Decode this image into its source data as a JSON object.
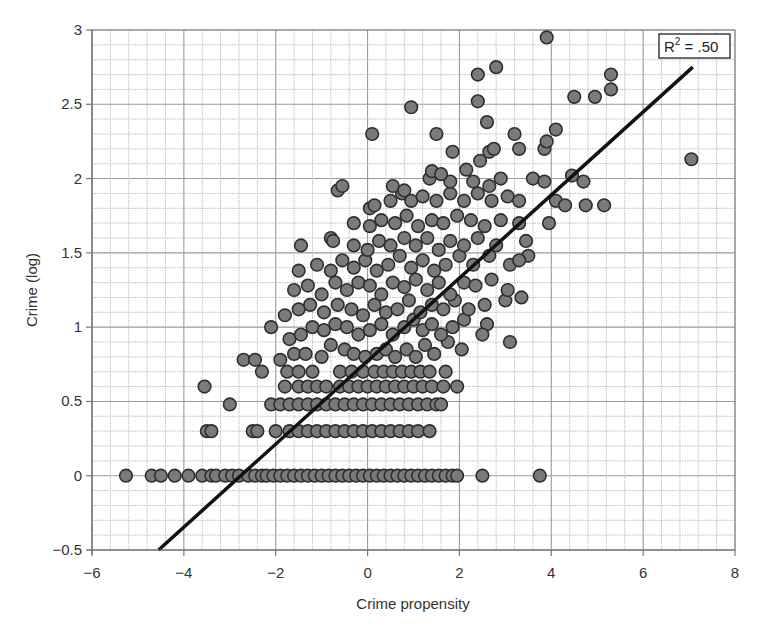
{
  "chart_data": {
    "type": "scatter",
    "title": "",
    "xlabel": "Crime propensity",
    "ylabel": "Crime (log)",
    "xlim": [
      -6,
      8
    ],
    "ylim": [
      -0.5,
      3
    ],
    "x_ticks": [
      -6,
      -4,
      -2,
      0,
      2,
      4,
      6,
      8
    ],
    "x_tick_labels": [
      "−6",
      "−4",
      "−2",
      "0",
      "2",
      "4",
      "6",
      "8"
    ],
    "y_ticks": [
      -0.5,
      0,
      0.5,
      1,
      1.5,
      2,
      2.5,
      3
    ],
    "y_tick_labels": [
      "−0.5",
      "0",
      "0.5",
      "1",
      "1.5",
      "2",
      "2.5",
      "3"
    ],
    "grid": true,
    "legend": null,
    "annotation": {
      "text_base": "R",
      "text_sup": "2",
      "text_rest": " = .50",
      "position": "top-right"
    },
    "regression_line": {
      "x": [
        -4.55,
        7.08
      ],
      "y": [
        -0.5,
        2.75
      ],
      "r_squared": 0.5
    },
    "marker_fill": "#7a7a7a",
    "marker_stroke": "#2e2e2e",
    "line_color": "#111111",
    "series": [
      {
        "name": "observations",
        "points": [
          [
            -5.26,
            0
          ],
          [
            -4.7,
            0
          ],
          [
            -4.5,
            0
          ],
          [
            -4.2,
            0
          ],
          [
            -3.9,
            0
          ],
          [
            -3.6,
            0
          ],
          [
            -3.4,
            0
          ],
          [
            -3.3,
            0
          ],
          [
            -3.1,
            0
          ],
          [
            -2.95,
            0
          ],
          [
            -2.8,
            0
          ],
          [
            -2.6,
            0
          ],
          [
            -2.45,
            0
          ],
          [
            -2.3,
            0
          ],
          [
            -2.2,
            0
          ],
          [
            -2.05,
            0
          ],
          [
            -1.9,
            0
          ],
          [
            -1.75,
            0
          ],
          [
            -1.6,
            0
          ],
          [
            -1.45,
            0
          ],
          [
            -1.3,
            0
          ],
          [
            -1.15,
            0
          ],
          [
            -1.0,
            0
          ],
          [
            -0.85,
            0
          ],
          [
            -0.7,
            0
          ],
          [
            -0.55,
            0
          ],
          [
            -0.4,
            0
          ],
          [
            -0.25,
            0
          ],
          [
            -0.1,
            0
          ],
          [
            0.05,
            0
          ],
          [
            0.2,
            0
          ],
          [
            0.35,
            0
          ],
          [
            0.5,
            0
          ],
          [
            0.65,
            0
          ],
          [
            0.8,
            0
          ],
          [
            0.95,
            0
          ],
          [
            1.1,
            0
          ],
          [
            1.25,
            0
          ],
          [
            1.4,
            0
          ],
          [
            1.55,
            0
          ],
          [
            1.7,
            0
          ],
          [
            1.85,
            0
          ],
          [
            1.95,
            0
          ],
          [
            2.5,
            0
          ],
          [
            3.75,
            0
          ],
          [
            -3.5,
            0.3
          ],
          [
            -3.4,
            0.3
          ],
          [
            -2.5,
            0.3
          ],
          [
            -2.4,
            0.3
          ],
          [
            -2.0,
            0.3
          ],
          [
            -1.7,
            0.3
          ],
          [
            -1.5,
            0.3
          ],
          [
            -1.3,
            0.3
          ],
          [
            -1.1,
            0.3
          ],
          [
            -0.9,
            0.3
          ],
          [
            -0.7,
            0.3
          ],
          [
            -0.5,
            0.3
          ],
          [
            -0.3,
            0.3
          ],
          [
            -0.1,
            0.3
          ],
          [
            0.1,
            0.3
          ],
          [
            0.3,
            0.3
          ],
          [
            0.5,
            0.3
          ],
          [
            0.7,
            0.3
          ],
          [
            0.9,
            0.3
          ],
          [
            1.1,
            0.3
          ],
          [
            1.35,
            0.3
          ],
          [
            -3.0,
            0.48
          ],
          [
            -2.1,
            0.48
          ],
          [
            -1.9,
            0.48
          ],
          [
            -1.7,
            0.48
          ],
          [
            -1.5,
            0.48
          ],
          [
            -1.3,
            0.48
          ],
          [
            -1.1,
            0.48
          ],
          [
            -0.9,
            0.48
          ],
          [
            -0.7,
            0.48
          ],
          [
            -0.5,
            0.48
          ],
          [
            -0.3,
            0.48
          ],
          [
            -0.1,
            0.48
          ],
          [
            0.1,
            0.48
          ],
          [
            0.3,
            0.48
          ],
          [
            0.5,
            0.48
          ],
          [
            0.7,
            0.48
          ],
          [
            0.9,
            0.48
          ],
          [
            1.1,
            0.48
          ],
          [
            1.3,
            0.48
          ],
          [
            1.5,
            0.48
          ],
          [
            1.6,
            0.48
          ],
          [
            -3.55,
            0.6
          ],
          [
            -1.8,
            0.6
          ],
          [
            -1.5,
            0.6
          ],
          [
            -1.3,
            0.6
          ],
          [
            -1.1,
            0.6
          ],
          [
            -0.9,
            0.6
          ],
          [
            -0.6,
            0.6
          ],
          [
            -0.4,
            0.6
          ],
          [
            -0.2,
            0.6
          ],
          [
            0.0,
            0.6
          ],
          [
            0.2,
            0.6
          ],
          [
            0.4,
            0.6
          ],
          [
            0.6,
            0.6
          ],
          [
            0.8,
            0.6
          ],
          [
            1.0,
            0.6
          ],
          [
            1.2,
            0.6
          ],
          [
            1.4,
            0.6
          ],
          [
            1.65,
            0.6
          ],
          [
            1.95,
            0.6
          ],
          [
            -2.7,
            0.78
          ],
          [
            -2.45,
            0.78
          ],
          [
            -2.3,
            0.7
          ],
          [
            -1.75,
            0.7
          ],
          [
            -1.5,
            0.7
          ],
          [
            -1.2,
            0.7
          ],
          [
            -0.6,
            0.7
          ],
          [
            -0.35,
            0.7
          ],
          [
            -0.1,
            0.7
          ],
          [
            0.15,
            0.7
          ],
          [
            0.35,
            0.7
          ],
          [
            0.55,
            0.7
          ],
          [
            0.75,
            0.7
          ],
          [
            0.95,
            0.7
          ],
          [
            1.15,
            0.7
          ],
          [
            1.35,
            0.7
          ],
          [
            1.7,
            0.7
          ],
          [
            -1.9,
            0.78
          ],
          [
            -1.6,
            0.82
          ],
          [
            -1.35,
            0.82
          ],
          [
            -1.0,
            0.8
          ],
          [
            -0.8,
            0.88
          ],
          [
            -0.5,
            0.85
          ],
          [
            -0.3,
            0.82
          ],
          [
            -0.05,
            0.8
          ],
          [
            0.2,
            0.82
          ],
          [
            0.4,
            0.85
          ],
          [
            0.6,
            0.8
          ],
          [
            0.85,
            0.85
          ],
          [
            1.05,
            0.8
          ],
          [
            1.25,
            0.88
          ],
          [
            1.45,
            0.82
          ],
          [
            1.75,
            0.9
          ],
          [
            2.05,
            0.85
          ],
          [
            -2.1,
            1.0
          ],
          [
            -1.7,
            0.92
          ],
          [
            -1.45,
            0.95
          ],
          [
            -1.2,
            1.0
          ],
          [
            -0.95,
            0.98
          ],
          [
            -0.7,
            1.02
          ],
          [
            -0.45,
            1.0
          ],
          [
            -0.2,
            0.95
          ],
          [
            0.05,
            0.98
          ],
          [
            0.3,
            1.02
          ],
          [
            0.55,
            0.95
          ],
          [
            0.8,
            1.0
          ],
          [
            1.0,
            1.05
          ],
          [
            1.2,
            0.98
          ],
          [
            1.4,
            1.02
          ],
          [
            1.6,
            0.95
          ],
          [
            1.85,
            1.0
          ],
          [
            2.1,
            1.05
          ],
          [
            2.6,
            1.02
          ],
          [
            2.5,
            0.95
          ],
          [
            3.1,
            0.9
          ],
          [
            -1.8,
            1.08
          ],
          [
            -1.5,
            1.12
          ],
          [
            -1.25,
            1.15
          ],
          [
            -0.95,
            1.1
          ],
          [
            -0.65,
            1.15
          ],
          [
            -0.35,
            1.12
          ],
          [
            -0.1,
            1.08
          ],
          [
            0.15,
            1.15
          ],
          [
            0.4,
            1.1
          ],
          [
            0.65,
            1.12
          ],
          [
            0.9,
            1.18
          ],
          [
            1.15,
            1.1
          ],
          [
            1.4,
            1.15
          ],
          [
            1.65,
            1.12
          ],
          [
            1.9,
            1.18
          ],
          [
            2.2,
            1.12
          ],
          [
            2.55,
            1.15
          ],
          [
            3.0,
            1.18
          ],
          [
            3.35,
            1.2
          ],
          [
            -1.6,
            1.25
          ],
          [
            -1.3,
            1.28
          ],
          [
            -1.0,
            1.22
          ],
          [
            -0.7,
            1.3
          ],
          [
            -0.45,
            1.25
          ],
          [
            -0.2,
            1.3
          ],
          [
            0.05,
            1.28
          ],
          [
            0.3,
            1.22
          ],
          [
            0.55,
            1.3
          ],
          [
            0.8,
            1.27
          ],
          [
            1.05,
            1.32
          ],
          [
            1.3,
            1.25
          ],
          [
            1.55,
            1.3
          ],
          [
            1.8,
            1.22
          ],
          [
            2.1,
            1.3
          ],
          [
            2.35,
            1.28
          ],
          [
            2.7,
            1.32
          ],
          [
            3.05,
            1.25
          ],
          [
            -1.5,
            1.38
          ],
          [
            -1.1,
            1.42
          ],
          [
            -0.8,
            1.38
          ],
          [
            -0.55,
            1.45
          ],
          [
            -0.3,
            1.4
          ],
          [
            -0.05,
            1.45
          ],
          [
            0.2,
            1.38
          ],
          [
            0.45,
            1.42
          ],
          [
            0.7,
            1.48
          ],
          [
            0.95,
            1.4
          ],
          [
            1.2,
            1.45
          ],
          [
            1.45,
            1.38
          ],
          [
            1.7,
            1.42
          ],
          [
            2.0,
            1.48
          ],
          [
            2.3,
            1.42
          ],
          [
            2.65,
            1.48
          ],
          [
            3.1,
            1.42
          ],
          [
            3.5,
            1.48
          ],
          [
            -1.45,
            1.55
          ],
          [
            -0.8,
            1.6
          ],
          [
            -0.75,
            1.58
          ],
          [
            -0.3,
            1.55
          ],
          [
            0.0,
            1.52
          ],
          [
            0.25,
            1.58
          ],
          [
            0.5,
            1.55
          ],
          [
            0.8,
            1.6
          ],
          [
            1.05,
            1.55
          ],
          [
            1.3,
            1.6
          ],
          [
            1.55,
            1.52
          ],
          [
            1.8,
            1.58
          ],
          [
            2.1,
            1.55
          ],
          [
            2.4,
            1.6
          ],
          [
            2.8,
            1.55
          ],
          [
            3.45,
            1.58
          ],
          [
            3.3,
            1.45
          ],
          [
            -0.3,
            1.7
          ],
          [
            0.05,
            1.68
          ],
          [
            0.3,
            1.72
          ],
          [
            0.6,
            1.7
          ],
          [
            0.85,
            1.75
          ],
          [
            1.1,
            1.68
          ],
          [
            1.4,
            1.72
          ],
          [
            1.65,
            1.7
          ],
          [
            1.95,
            1.75
          ],
          [
            2.25,
            1.72
          ],
          [
            2.55,
            1.68
          ],
          [
            2.9,
            1.72
          ],
          [
            3.3,
            1.7
          ],
          [
            3.95,
            1.7
          ],
          [
            0.05,
            1.8
          ],
          [
            0.15,
            1.82
          ],
          [
            0.5,
            1.85
          ],
          [
            0.75,
            1.9
          ],
          [
            0.95,
            1.85
          ],
          [
            1.2,
            1.88
          ],
          [
            1.5,
            1.85
          ],
          [
            1.8,
            1.9
          ],
          [
            2.1,
            1.85
          ],
          [
            2.4,
            1.9
          ],
          [
            2.7,
            1.85
          ],
          [
            3.05,
            1.88
          ],
          [
            3.3,
            1.85
          ],
          [
            4.1,
            1.85
          ],
          [
            4.3,
            1.82
          ],
          [
            4.75,
            1.82
          ],
          [
            5.15,
            1.82
          ],
          [
            -0.65,
            1.92
          ],
          [
            -0.55,
            1.95
          ],
          [
            0.55,
            1.95
          ],
          [
            0.8,
            1.92
          ],
          [
            1.35,
            2.0
          ],
          [
            1.8,
            1.98
          ],
          [
            2.3,
            1.98
          ],
          [
            2.65,
            1.95
          ],
          [
            2.9,
            2.0
          ],
          [
            3.6,
            2.0
          ],
          [
            3.85,
            1.98
          ],
          [
            4.45,
            2.02
          ],
          [
            4.7,
            1.98
          ],
          [
            1.4,
            2.05
          ],
          [
            1.6,
            2.03
          ],
          [
            2.15,
            2.06
          ],
          [
            2.45,
            2.12
          ],
          [
            2.65,
            2.18
          ],
          [
            2.75,
            2.2
          ],
          [
            3.3,
            2.2
          ],
          [
            3.85,
            2.2
          ],
          [
            3.9,
            2.25
          ],
          [
            4.1,
            2.33
          ],
          [
            0.1,
            2.3
          ],
          [
            1.5,
            2.3
          ],
          [
            1.85,
            2.18
          ],
          [
            3.2,
            2.3
          ],
          [
            0.95,
            2.48
          ],
          [
            2.4,
            2.52
          ],
          [
            2.6,
            2.38
          ],
          [
            4.5,
            2.55
          ],
          [
            4.95,
            2.55
          ],
          [
            5.3,
            2.6
          ],
          [
            5.3,
            2.7
          ],
          [
            2.4,
            2.7
          ],
          [
            2.8,
            2.75
          ],
          [
            3.9,
            2.95
          ],
          [
            7.05,
            2.13
          ]
        ]
      }
    ]
  }
}
